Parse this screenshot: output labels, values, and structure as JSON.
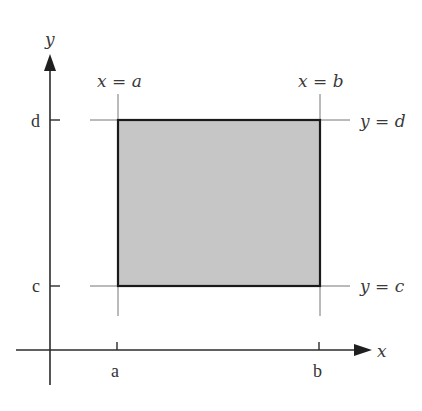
{
  "diagram": {
    "axes": {
      "x_label": "x",
      "y_label": "y"
    },
    "ticks": {
      "x": [
        {
          "id": "a",
          "label": "a"
        },
        {
          "id": "b",
          "label": "b"
        }
      ],
      "y": [
        {
          "id": "c",
          "label": "c"
        },
        {
          "id": "d",
          "label": "d"
        }
      ]
    },
    "boundary_lines": {
      "left": "x = a",
      "right": "x = b",
      "top": "y = d",
      "bottom": "y = c"
    },
    "region": {
      "fill_color": "#c6c6c6",
      "stroke_color": "#1a1a1a"
    },
    "colors": {
      "axis": "#2b2b2b",
      "guide": "#777777",
      "text": "#333333"
    }
  }
}
